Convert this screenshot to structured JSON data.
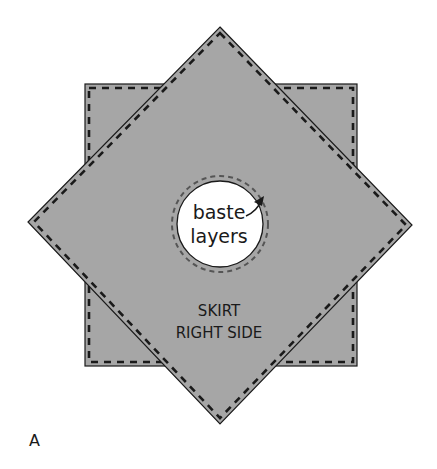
{
  "figure": {
    "panel_label": "A",
    "hole_label_line1": "baste",
    "hole_label_line2": "layers",
    "skirt_label_line1": "SKIRT",
    "skirt_label_line2": "RIGHT SIDE"
  },
  "colors": {
    "fabric_fill": "#a6a6a6",
    "outline": "#1a1a1a",
    "hole_fill": "#ffffff",
    "baste_dash": "#555555"
  },
  "shapes": {
    "square": {
      "x": 85,
      "y": 84,
      "width": 272,
      "height": 282
    },
    "diamond": {
      "top": [
        220,
        27
      ],
      "right": [
        412,
        225
      ],
      "bottom": [
        220,
        424
      ],
      "left": [
        28,
        222
      ]
    },
    "center_hole": {
      "cx": 220,
      "cy": 224,
      "r": 43,
      "baste_r": 48
    }
  }
}
